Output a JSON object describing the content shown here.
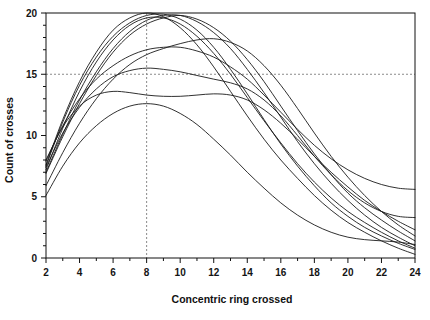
{
  "chart_data": {
    "type": "line",
    "title": "",
    "xlabel": "Concentric ring crossed",
    "ylabel": "Count of crosses",
    "xlim": [
      2,
      24
    ],
    "ylim": [
      0,
      20
    ],
    "grid": false,
    "legend": "none",
    "x_ticks": [
      2,
      4,
      6,
      8,
      10,
      12,
      14,
      16,
      18,
      20,
      22,
      24
    ],
    "x_tick_labels": [
      "2",
      "4",
      "6",
      "8",
      "10",
      "12",
      "14",
      "16",
      "18",
      "20",
      "22",
      "24"
    ],
    "x_minor_ticks": [
      3,
      5,
      7,
      9,
      11,
      13,
      15,
      17,
      19,
      21,
      23
    ],
    "y_ticks": [
      0,
      5,
      10,
      15,
      20
    ],
    "y_tick_labels": [
      "0",
      "5",
      "10",
      "15",
      "20"
    ],
    "y_minor_ticks": [
      1,
      2,
      3,
      4,
      6,
      7,
      8,
      9,
      11,
      12,
      13,
      14,
      16,
      17,
      18,
      19
    ],
    "reference_lines": [
      {
        "orientation": "horizontal",
        "value": 15,
        "style": "dashed",
        "color": "#8a8a8a"
      },
      {
        "orientation": "vertical",
        "value": 8,
        "style": "dashed",
        "color": "#8a8a8a"
      }
    ],
    "x": [
      2,
      3,
      4,
      5,
      6,
      7,
      8,
      9,
      10,
      11,
      12,
      13,
      14,
      15,
      16,
      17,
      18,
      19,
      20,
      21,
      22,
      23,
      24
    ],
    "series": [
      {
        "name": "cell-1",
        "color": "#1a1a1a",
        "values": [
          7.6,
          11.3,
          14.4,
          16.8,
          18.6,
          19.6,
          20.0,
          19.7,
          18.8,
          17.4,
          15.6,
          13.6,
          11.6,
          9.7,
          8.0,
          6.5,
          5.1,
          3.9,
          2.9,
          2.1,
          1.4,
          0.8,
          0.3
        ]
      },
      {
        "name": "cell-2",
        "color": "#1a1a1a",
        "values": [
          7.2,
          10.6,
          13.6,
          16.0,
          17.8,
          19.0,
          19.6,
          19.6,
          19.1,
          18.1,
          16.7,
          15.0,
          13.1,
          11.2,
          9.4,
          7.7,
          6.2,
          4.9,
          3.8,
          2.9,
          2.1,
          1.4,
          0.8
        ]
      },
      {
        "name": "cell-3",
        "color": "#1a1a1a",
        "values": [
          6.9,
          9.9,
          12.6,
          14.9,
          16.8,
          18.2,
          19.1,
          19.6,
          19.8,
          19.5,
          18.8,
          17.7,
          16.2,
          14.4,
          12.4,
          10.4,
          8.5,
          6.8,
          5.3,
          4.1,
          3.1,
          2.2,
          1.4
        ]
      },
      {
        "name": "cell-4",
        "color": "#1a1a1a",
        "values": [
          7.9,
          10.8,
          13.0,
          14.6,
          15.7,
          16.5,
          17.0,
          17.2,
          17.2,
          16.9,
          16.4,
          15.6,
          14.6,
          13.3,
          11.9,
          10.5,
          9.2,
          8.1,
          7.2,
          6.5,
          6.0,
          5.7,
          5.6
        ]
      },
      {
        "name": "cell-5",
        "color": "#1a1a1a",
        "values": [
          7.4,
          10.2,
          12.3,
          13.8,
          14.8,
          15.3,
          15.5,
          15.4,
          15.2,
          14.9,
          14.6,
          14.3,
          13.8,
          12.9,
          11.6,
          10.0,
          8.3,
          6.8,
          5.5,
          4.5,
          3.8,
          3.4,
          3.3
        ]
      },
      {
        "name": "cell-6",
        "color": "#1a1a1a",
        "values": [
          8.0,
          10.7,
          12.4,
          13.3,
          13.6,
          13.5,
          13.3,
          13.2,
          13.2,
          13.3,
          13.4,
          13.3,
          12.9,
          12.1,
          11.0,
          9.7,
          8.3,
          7.0,
          5.8,
          4.7,
          3.8,
          3.0,
          2.3
        ]
      },
      {
        "name": "cell-7",
        "color": "#1a1a1a",
        "values": [
          5.9,
          8.6,
          11.0,
          13.0,
          14.6,
          15.8,
          16.6,
          17.1,
          17.5,
          17.8,
          17.9,
          17.6,
          16.9,
          15.7,
          14.1,
          12.2,
          10.2,
          8.3,
          6.6,
          5.1,
          3.8,
          2.7,
          1.8
        ]
      },
      {
        "name": "cell-8",
        "color": "#1a1a1a",
        "values": [
          7.5,
          11.1,
          14.1,
          16.4,
          18.1,
          19.2,
          19.8,
          19.9,
          19.5,
          18.6,
          17.2,
          15.4,
          13.4,
          11.3,
          9.3,
          7.5,
          5.9,
          4.5,
          3.4,
          2.5,
          1.8,
          1.2,
          0.7
        ]
      },
      {
        "name": "cell-9",
        "color": "#1a1a1a",
        "values": [
          5.1,
          7.5,
          9.4,
          10.8,
          11.8,
          12.4,
          12.6,
          12.4,
          11.8,
          10.9,
          9.7,
          8.4,
          7.0,
          5.7,
          4.5,
          3.5,
          2.7,
          2.1,
          1.7,
          1.5,
          1.4,
          1.3,
          1.1
        ]
      },
      {
        "name": "cell-10",
        "color": "#1a1a1a",
        "values": [
          7.0,
          10.1,
          12.9,
          15.2,
          17.1,
          18.5,
          19.4,
          19.8,
          19.8,
          19.3,
          18.4,
          17.1,
          15.4,
          13.5,
          11.5,
          9.5,
          7.7,
          6.1,
          4.7,
          3.5,
          2.5,
          1.7,
          1.0
        ]
      }
    ]
  },
  "labels": {
    "y_axis_title": "Count of crosses",
    "x_axis_title": "Concentric ring crossed"
  }
}
